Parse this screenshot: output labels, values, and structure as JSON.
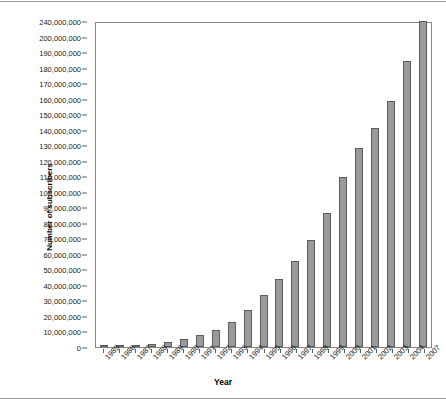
{
  "chart_data": {
    "type": "bar",
    "title": "",
    "xlabel": "Year",
    "ylabel": "Number of subscribers",
    "categories": [
      "1985",
      "1986",
      "1987",
      "1988",
      "1989",
      "1990",
      "1991",
      "1992",
      "1993",
      "1994",
      "1995",
      "1996",
      "1997",
      "1998",
      "1999",
      "2000",
      "2001",
      "2002",
      "2003",
      "2004",
      "2007"
    ],
    "values": [
      340000,
      680000,
      1230000,
      2070000,
      3510000,
      5280000,
      7560000,
      11030000,
      16010000,
      24130000,
      33790000,
      44040000,
      55310000,
      69210000,
      86050000,
      109480000,
      128500000,
      141000000,
      158700000,
      184000000,
      240000000
    ],
    "ylim": [
      0,
      240000000
    ],
    "ytick_values": [
      0,
      10000000,
      20000000,
      30000000,
      40000000,
      50000000,
      60000000,
      70000000,
      80000000,
      90000000,
      100000000,
      110000000,
      120000000,
      130000000,
      140000000,
      150000000,
      160000000,
      170000000,
      180000000,
      190000000,
      200000000,
      240000000
    ],
    "ytick_labels": [
      "0",
      "10,000,000",
      "20,000,000",
      "30,000,000",
      "40,000,000",
      "50,000,000",
      "60,000,000",
      "70,000,000",
      "80,000,000",
      "90,000,000",
      "100,000,000",
      "110,000,000",
      "120,000,000",
      "130,000,000",
      "140,000,000",
      "150,000,000",
      "160,000,000",
      "170,000,000",
      "180,000,000",
      "190,000,000",
      "200,000,000",
      "240,000,000"
    ],
    "grid": false,
    "legend": null,
    "bar_color": "#9a9a9a",
    "bar_edge_color": "#5d5d5d",
    "axis_color": "#868686",
    "text_color": "#1a1a1a"
  }
}
